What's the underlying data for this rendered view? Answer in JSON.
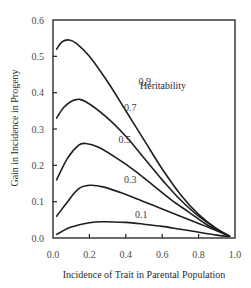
{
  "chart_data": {
    "type": "line",
    "title": "",
    "xlabel": "Incidence of Trait in Parental Population",
    "ylabel": "Gain in Incidence in Progeny",
    "xlim": [
      0.0,
      1.0
    ],
    "ylim": [
      0.0,
      0.6
    ],
    "x_ticks": [
      "0.0",
      "0.2",
      "0.4",
      "0.6",
      "0.8",
      "1.0"
    ],
    "y_ticks": [
      "0.0",
      "0.1",
      "0.2",
      "0.3",
      "0.4",
      "0.5",
      "0.6"
    ],
    "grid": false,
    "legend": {
      "title": "Heritability",
      "position": "upper right (inline curve labels)"
    },
    "series": [
      {
        "name": "0.9",
        "label_pos": [
          0.47,
          0.43
        ],
        "points": [
          [
            0.02,
            0.52
          ],
          [
            0.05,
            0.54
          ],
          [
            0.09,
            0.545
          ],
          [
            0.13,
            0.535
          ],
          [
            0.2,
            0.5
          ],
          [
            0.3,
            0.43
          ],
          [
            0.4,
            0.35
          ],
          [
            0.5,
            0.27
          ],
          [
            0.6,
            0.19
          ],
          [
            0.7,
            0.12
          ],
          [
            0.8,
            0.065
          ],
          [
            0.9,
            0.025
          ],
          [
            0.97,
            0.005
          ]
        ]
      },
      {
        "name": "0.7",
        "label_pos": [
          0.39,
          0.36
        ],
        "points": [
          [
            0.02,
            0.33
          ],
          [
            0.06,
            0.36
          ],
          [
            0.12,
            0.38
          ],
          [
            0.18,
            0.375
          ],
          [
            0.3,
            0.33
          ],
          [
            0.4,
            0.28
          ],
          [
            0.5,
            0.22
          ],
          [
            0.6,
            0.16
          ],
          [
            0.7,
            0.105
          ],
          [
            0.8,
            0.06
          ],
          [
            0.9,
            0.025
          ],
          [
            0.97,
            0.005
          ]
        ]
      },
      {
        "name": "0.5",
        "label_pos": [
          0.36,
          0.27
        ],
        "points": [
          [
            0.02,
            0.16
          ],
          [
            0.08,
            0.22
          ],
          [
            0.14,
            0.255
          ],
          [
            0.18,
            0.26
          ],
          [
            0.25,
            0.25
          ],
          [
            0.35,
            0.22
          ],
          [
            0.45,
            0.185
          ],
          [
            0.55,
            0.145
          ],
          [
            0.65,
            0.105
          ],
          [
            0.75,
            0.07
          ],
          [
            0.85,
            0.035
          ],
          [
            0.97,
            0.005
          ]
        ]
      },
      {
        "name": "0.3",
        "label_pos": [
          0.39,
          0.16
        ],
        "points": [
          [
            0.02,
            0.06
          ],
          [
            0.08,
            0.1
          ],
          [
            0.14,
            0.135
          ],
          [
            0.2,
            0.145
          ],
          [
            0.28,
            0.14
          ],
          [
            0.4,
            0.12
          ],
          [
            0.5,
            0.1
          ],
          [
            0.6,
            0.08
          ],
          [
            0.7,
            0.06
          ],
          [
            0.8,
            0.04
          ],
          [
            0.9,
            0.02
          ],
          [
            0.97,
            0.005
          ]
        ]
      },
      {
        "name": "0.1",
        "label_pos": [
          0.45,
          0.065
        ],
        "points": [
          [
            0.02,
            0.01
          ],
          [
            0.1,
            0.03
          ],
          [
            0.2,
            0.042
          ],
          [
            0.27,
            0.045
          ],
          [
            0.4,
            0.043
          ],
          [
            0.5,
            0.038
          ],
          [
            0.6,
            0.032
          ],
          [
            0.7,
            0.024
          ],
          [
            0.8,
            0.016
          ],
          [
            0.9,
            0.008
          ],
          [
            0.97,
            0.004
          ]
        ]
      }
    ]
  }
}
